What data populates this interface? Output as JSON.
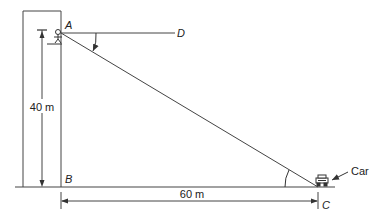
{
  "diagram": {
    "points": {
      "A": "A",
      "B": "B",
      "C": "C",
      "D": "D"
    },
    "labels": {
      "height": "40 m",
      "distance": "60 m",
      "car": "Car"
    },
    "colors": {
      "line": "#333333",
      "background": "#ffffff"
    }
  }
}
